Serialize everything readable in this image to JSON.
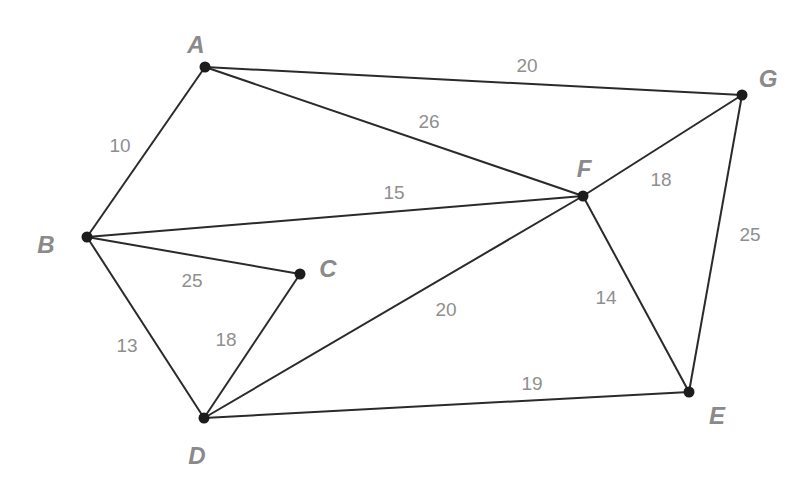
{
  "diagram": {
    "type": "weighted-undirected-graph",
    "nodes": [
      {
        "id": "A",
        "label": "A",
        "x": 205,
        "y": 67,
        "lx": 196,
        "ly": 47
      },
      {
        "id": "B",
        "label": "B",
        "x": 87,
        "y": 237,
        "lx": 46,
        "ly": 247
      },
      {
        "id": "C",
        "label": "C",
        "x": 300,
        "y": 274,
        "lx": 328,
        "ly": 271
      },
      {
        "id": "D",
        "label": "D",
        "x": 204,
        "y": 418,
        "lx": 197,
        "ly": 458
      },
      {
        "id": "E",
        "label": "E",
        "x": 689,
        "y": 392,
        "lx": 717,
        "ly": 418
      },
      {
        "id": "F",
        "label": "F",
        "x": 583,
        "y": 196,
        "lx": 584,
        "ly": 171
      },
      {
        "id": "G",
        "label": "G",
        "x": 742,
        "y": 95,
        "lx": 768,
        "ly": 81
      }
    ],
    "edges": [
      {
        "from": "A",
        "to": "B",
        "weight": "10",
        "lx": 120,
        "ly": 147
      },
      {
        "from": "A",
        "to": "G",
        "weight": "20",
        "lx": 527,
        "ly": 67
      },
      {
        "from": "A",
        "to": "F",
        "weight": "26",
        "lx": 429,
        "ly": 123
      },
      {
        "from": "B",
        "to": "F",
        "weight": "15",
        "lx": 394,
        "ly": 194
      },
      {
        "from": "B",
        "to": "C",
        "weight": "25",
        "lx": 192,
        "ly": 282
      },
      {
        "from": "B",
        "to": "D",
        "weight": "13",
        "lx": 127,
        "ly": 347
      },
      {
        "from": "C",
        "to": "D",
        "weight": "18",
        "lx": 226,
        "ly": 341
      },
      {
        "from": "D",
        "to": "F",
        "weight": "20",
        "lx": 446,
        "ly": 311
      },
      {
        "from": "D",
        "to": "E",
        "weight": "19",
        "lx": 532,
        "ly": 385
      },
      {
        "from": "F",
        "to": "G",
        "weight": "18",
        "lx": 661,
        "ly": 181
      },
      {
        "from": "F",
        "to": "E",
        "weight": "14",
        "lx": 606,
        "ly": 299
      },
      {
        "from": "G",
        "to": "E",
        "weight": "25",
        "lx": 750,
        "ly": 236
      }
    ]
  }
}
